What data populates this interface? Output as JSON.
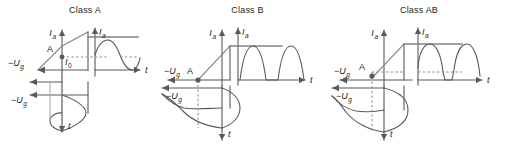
{
  "figure": {
    "background": "#ffffff",
    "line_color": "#58595b",
    "text_color": "#231f20",
    "dash_color": "#8c8c8c",
    "panels": [
      {
        "id": "class-a",
        "title": "Class A",
        "bias_point_label": "A",
        "axes": {
          "transfer_vertical_label": "I",
          "transfer_vertical_sub": "a",
          "output_vertical_label": "I",
          "output_vertical_sub": "a",
          "quiescent_label": "I",
          "quiescent_sub": "0",
          "horizontal_label": "t",
          "input_axis_label": "−U",
          "input_axis_sub": "g",
          "drive_axis_label": "−U",
          "drive_axis_sub": "g",
          "time_down_label": "t"
        },
        "waveform": {
          "type": "full-sine",
          "conduction_angle_deg": 360,
          "pedestal": "I0 mid-scale",
          "bias_position": "mid-point of load line"
        }
      },
      {
        "id": "class-b",
        "title": "Class B",
        "bias_point_label": "A",
        "axes": {
          "transfer_vertical_label": "I",
          "transfer_vertical_sub": "a",
          "output_vertical_label": "I",
          "output_vertical_sub": "a",
          "horizontal_label": "t",
          "input_axis_label": "−U",
          "input_axis_sub": "g",
          "drive_axis_label": "−U",
          "drive_axis_sub": "g",
          "time_down_label": "t"
        },
        "waveform": {
          "type": "half-sine-pulses",
          "conduction_angle_deg": 180,
          "pedestal": "zero",
          "bias_position": "cut-off"
        }
      },
      {
        "id": "class-ab",
        "title": "Class AB",
        "bias_point_label": "A",
        "axes": {
          "transfer_vertical_label": "I",
          "transfer_vertical_sub": "a",
          "output_vertical_label": "I",
          "output_vertical_sub": "a",
          "horizontal_label": "t",
          "input_axis_label": "−U",
          "input_axis_sub": "g",
          "drive_axis_label": "−U",
          "drive_axis_sub": "g",
          "time_down_label": "t"
        },
        "waveform": {
          "type": "wide-pulses",
          "conduction_angle_deg": 240,
          "pedestal": "small standing current",
          "bias_position": "between A and B"
        }
      }
    ]
  }
}
